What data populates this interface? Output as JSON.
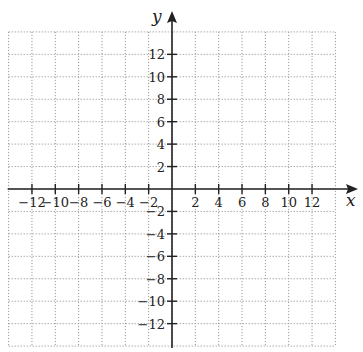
{
  "chart_data": {
    "type": "scatter",
    "title": "",
    "xlabel": "x",
    "ylabel": "y",
    "xlim": [
      -14,
      14
    ],
    "ylim": [
      -14,
      14
    ],
    "grid": true,
    "grid_style": "dotted",
    "grid_step": 2,
    "x_ticks": [
      -12,
      -10,
      -8,
      -6,
      -4,
      -2,
      2,
      4,
      6,
      8,
      10,
      12
    ],
    "y_ticks": [
      -12,
      -10,
      -8,
      -6,
      -4,
      -2,
      2,
      4,
      6,
      8,
      10,
      12
    ],
    "x_tick_labels": [
      "−12",
      "−10",
      "−8",
      "−6",
      "−4",
      "−2",
      "2",
      "4",
      "6",
      "8",
      "10",
      "12"
    ],
    "y_tick_labels": [
      "−12",
      "−10",
      "−8",
      "−6",
      "−4",
      "−2",
      "2",
      "4",
      "6",
      "8",
      "10",
      "12"
    ],
    "series": [],
    "legend": null
  },
  "colors": {
    "axis": "#222222",
    "grid": "#9a9a9a",
    "background": "#ffffff"
  }
}
